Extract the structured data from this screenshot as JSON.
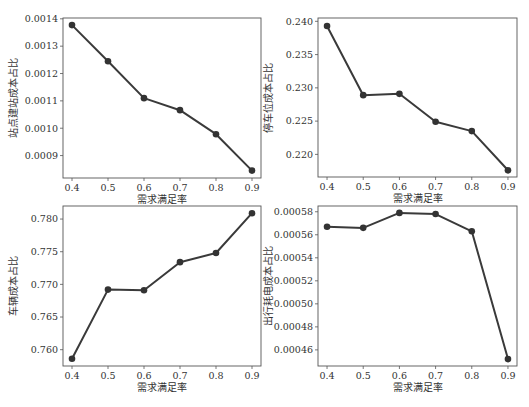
{
  "figure": {
    "line_color": "#3a3a3a",
    "marker_color": "#333333",
    "frame_color": "#555555"
  },
  "chart_data": [
    {
      "type": "line",
      "id": "station-construction",
      "title": "",
      "xlabel": "需求满足率",
      "ylabel": "站点建站成本占比",
      "x": [
        0.4,
        0.5,
        0.6,
        0.7,
        0.8,
        0.9
      ],
      "values": [
        0.001377,
        0.001245,
        0.00111,
        0.001066,
        0.000978,
        0.000845
      ],
      "xticks": [
        "0.4",
        "0.5",
        "0.6",
        "0.7",
        "0.8",
        "0.9"
      ],
      "yticks": [
        "0.0009",
        "0.0010",
        "0.0011",
        "0.0012",
        "0.0013",
        "0.0014"
      ],
      "ytick_values": [
        0.0009,
        0.001,
        0.0011,
        0.0012,
        0.0013,
        0.0014
      ],
      "xlim": [
        0.375,
        0.925
      ],
      "ylim": [
        0.000818,
        0.001403
      ],
      "grid": false,
      "frame": {
        "left": 63,
        "top": 18,
        "right": 261,
        "bottom": 178
      }
    },
    {
      "type": "line",
      "id": "parking-space",
      "title": "",
      "xlabel": "需求满足率",
      "ylabel": "停车位成本占比",
      "x": [
        0.4,
        0.5,
        0.6,
        0.7,
        0.8,
        0.9
      ],
      "values": [
        0.2393,
        0.2289,
        0.2291,
        0.2249,
        0.2235,
        0.2176
      ],
      "xticks": [
        "0.4",
        "0.5",
        "0.6",
        "0.7",
        "0.8",
        "0.9"
      ],
      "yticks": [
        "0.220",
        "0.225",
        "0.230",
        "0.235",
        "0.240"
      ],
      "ytick_values": [
        0.22,
        0.225,
        0.23,
        0.235,
        0.24
      ],
      "xlim": [
        0.375,
        0.925
      ],
      "ylim": [
        0.2166,
        0.2405
      ],
      "grid": false,
      "frame": {
        "left": 318,
        "top": 18,
        "right": 517,
        "bottom": 177
      }
    },
    {
      "type": "line",
      "id": "vehicle",
      "title": "",
      "xlabel": "需求满足率",
      "ylabel": "车辆成本占比",
      "x": [
        0.4,
        0.5,
        0.6,
        0.7,
        0.8,
        0.9
      ],
      "values": [
        0.7586,
        0.7692,
        0.7691,
        0.7734,
        0.7748,
        0.7809
      ],
      "xticks": [
        "0.4",
        "0.5",
        "0.6",
        "0.7",
        "0.8",
        "0.9"
      ],
      "yticks": [
        "0.760",
        "0.765",
        "0.770",
        "0.775",
        "0.780"
      ],
      "ytick_values": [
        0.76,
        0.765,
        0.77,
        0.775,
        0.78
      ],
      "xlim": [
        0.375,
        0.925
      ],
      "ylim": [
        0.7575,
        0.782
      ],
      "grid": false,
      "frame": {
        "left": 63,
        "top": 206,
        "right": 261,
        "bottom": 366
      }
    },
    {
      "type": "line",
      "id": "travel-electricity",
      "title": "",
      "xlabel": "需求满足率",
      "ylabel": "出行耗电成本占比",
      "x": [
        0.4,
        0.5,
        0.6,
        0.7,
        0.8,
        0.9
      ],
      "values": [
        0.000567,
        0.000566,
        0.000579,
        0.000578,
        0.000563,
        0.000452
      ],
      "xticks": [
        "0.4",
        "0.5",
        "0.6",
        "0.7",
        "0.8",
        "0.9"
      ],
      "yticks": [
        "0.00046",
        "0.00048",
        "0.00050",
        "0.00052",
        "0.00054",
        "0.00056",
        "0.00058"
      ],
      "ytick_values": [
        0.00046,
        0.00048,
        0.0005,
        0.00052,
        0.00054,
        0.00056,
        0.00058
      ],
      "xlim": [
        0.375,
        0.925
      ],
      "ylim": [
        0.000446,
        0.000585
      ],
      "grid": false,
      "frame": {
        "left": 318,
        "top": 206,
        "right": 517,
        "bottom": 366
      }
    }
  ]
}
